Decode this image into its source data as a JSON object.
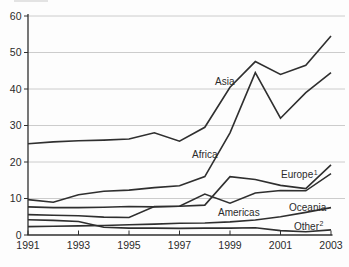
{
  "figure": {
    "background": "#fdfdfd"
  },
  "chart_data": {
    "type": "line",
    "title": "",
    "xlabel": "",
    "ylabel": "",
    "x": [
      1991,
      1992,
      1993,
      1994,
      1995,
      1996,
      1997,
      1998,
      1999,
      2000,
      2001,
      2002,
      2003
    ],
    "xticks": [
      1991,
      1993,
      1995,
      1997,
      1999,
      2001,
      2003
    ],
    "ylim": [
      0,
      60
    ],
    "yticks": [
      0,
      10,
      20,
      30,
      40,
      50,
      60
    ],
    "grid": "horizontal",
    "legend": "inline-labels",
    "series": [
      {
        "name": "asia",
        "label": "Asia",
        "sup": "",
        "values": [
          25,
          25.5,
          25.8,
          26,
          26.3,
          28,
          25.7,
          29.5,
          40.5,
          47.5,
          44,
          46.5,
          54.5
        ]
      },
      {
        "name": "africa",
        "label": "Africa",
        "sup": "",
        "values": [
          9.7,
          9,
          11,
          12,
          12.3,
          13,
          13.5,
          16,
          28,
          44.5,
          32,
          39,
          44.5
        ]
      },
      {
        "name": "europe",
        "label": "Europe",
        "sup": "1",
        "values": [
          7.7,
          7.5,
          7.5,
          7.6,
          7.8,
          7.7,
          7.9,
          8.2,
          16,
          15.2,
          13.6,
          12.7,
          19.2
        ]
      },
      {
        "name": "americas",
        "label": "Americas",
        "sup": "",
        "values": [
          5.6,
          5.4,
          5.3,
          4.9,
          4.8,
          7.8,
          7.9,
          11.2,
          8.7,
          11.5,
          12.2,
          12.1,
          16.8
        ]
      },
      {
        "name": "oceania",
        "label": "Oceania",
        "sup": "",
        "values": [
          2.3,
          2.4,
          2.5,
          2.6,
          2.8,
          3,
          3.2,
          3.3,
          3.6,
          4.1,
          5,
          6.2,
          7.5
        ]
      },
      {
        "name": "other",
        "label": "Other",
        "sup": "2",
        "values": [
          4.2,
          4,
          3.7,
          2.1,
          1.9,
          1.9,
          1.8,
          1.9,
          1.9,
          2,
          1.2,
          0.9,
          1.4
        ]
      }
    ],
    "colors": {
      "line": "#2f2f2f",
      "grid": "#c6c6c6",
      "axis": "#2f2f2f",
      "text": "#2b2b2b"
    }
  }
}
